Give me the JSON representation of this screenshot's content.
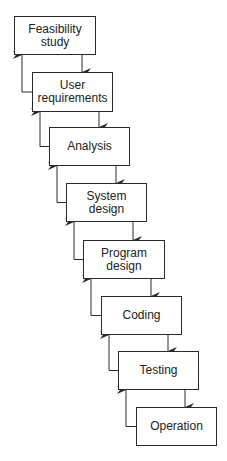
{
  "diagram": {
    "type": "waterfall-model",
    "stages": [
      {
        "label": "Feasibility study",
        "lines": [
          "Feasibility",
          "study"
        ],
        "x": 14,
        "y": 16,
        "w": 82,
        "h": 39
      },
      {
        "label": "User requirements",
        "lines": [
          "User",
          "requirements"
        ],
        "x": 32,
        "y": 72,
        "w": 81,
        "h": 40
      },
      {
        "label": "Analysis",
        "lines": [
          "Analysis"
        ],
        "x": 49,
        "y": 127,
        "w": 81,
        "h": 39
      },
      {
        "label": "System design",
        "lines": [
          "System",
          "design"
        ],
        "x": 66,
        "y": 183,
        "w": 81,
        "h": 39
      },
      {
        "label": "Program design",
        "lines": [
          "Program",
          "design"
        ],
        "x": 83,
        "y": 240,
        "w": 82,
        "h": 39
      },
      {
        "label": "Coding",
        "lines": [
          "Coding"
        ],
        "x": 101,
        "y": 296,
        "w": 81,
        "h": 39
      },
      {
        "label": "Testing",
        "lines": [
          "Testing"
        ],
        "x": 118,
        "y": 351,
        "w": 81,
        "h": 39
      },
      {
        "label": "Operation",
        "lines": [
          "Operation"
        ],
        "x": 136,
        "y": 407,
        "w": 81,
        "h": 39
      }
    ],
    "edges": {
      "forward": "each stage flows down to the next stage",
      "feedback": "each stage (except Operation) has a return arrow to the previous stage"
    },
    "colors": {
      "line": "#2a2a2a",
      "background": "#ffffff",
      "text": "#222222"
    }
  }
}
